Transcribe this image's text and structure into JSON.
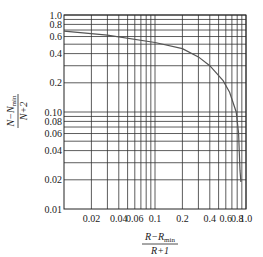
{
  "chart_data": {
    "type": "line",
    "title": "",
    "xlabel": {
      "numerator": "R−R",
      "numerator_sub": "min",
      "denominator": "R+1"
    },
    "ylabel": {
      "numerator": "N−N",
      "numerator_sub": "min",
      "denominator": "N+2"
    },
    "xscale": "log",
    "yscale": "log",
    "xlim": [
      0.01,
      1.0
    ],
    "ylim": [
      0.01,
      1.0
    ],
    "grid": true,
    "legend": null,
    "x_tick_labels": [
      "0.02",
      "0.04",
      "0.06",
      "0.1",
      "0.2",
      "0.4",
      "0.6",
      "0.8",
      "1.0"
    ],
    "x_ticks": [
      0.02,
      0.04,
      0.06,
      0.1,
      0.2,
      0.4,
      0.6,
      0.8,
      1.0
    ],
    "y_tick_labels": [
      "1.0",
      "0.8",
      "0.6",
      "0.4",
      "0.2",
      "0.10",
      "0.08",
      "0.06",
      "0.04",
      "0.02",
      "0.01"
    ],
    "y_ticks": [
      1.0,
      0.8,
      0.6,
      0.4,
      0.2,
      0.1,
      0.08,
      0.06,
      0.04,
      0.02,
      0.01
    ],
    "x_gridlines": [
      0.02,
      0.03,
      0.04,
      0.05,
      0.06,
      0.07,
      0.08,
      0.09,
      0.1,
      0.2,
      0.3,
      0.4,
      0.5,
      0.6,
      0.7,
      0.8,
      0.9,
      1.0
    ],
    "y_gridlines": [
      0.02,
      0.03,
      0.04,
      0.05,
      0.06,
      0.07,
      0.08,
      0.09,
      0.1,
      0.2,
      0.3,
      0.4,
      0.5,
      0.6,
      0.7,
      0.8,
      0.9,
      1.0
    ],
    "series": [
      {
        "name": "Gilliland correlation",
        "color": "#555555",
        "x": [
          0.01,
          0.03,
          0.1,
          0.2,
          0.3,
          0.4,
          0.56,
          0.66,
          0.78,
          0.83,
          0.86,
          0.88
        ],
        "y": [
          0.68,
          0.62,
          0.52,
          0.45,
          0.37,
          0.3,
          0.21,
          0.16,
          0.1,
          0.06,
          0.025,
          0.019
        ]
      }
    ]
  },
  "colors": {
    "grid": "#333333",
    "axis": "#222222",
    "curve": "#555555",
    "background": "#ffffff"
  }
}
